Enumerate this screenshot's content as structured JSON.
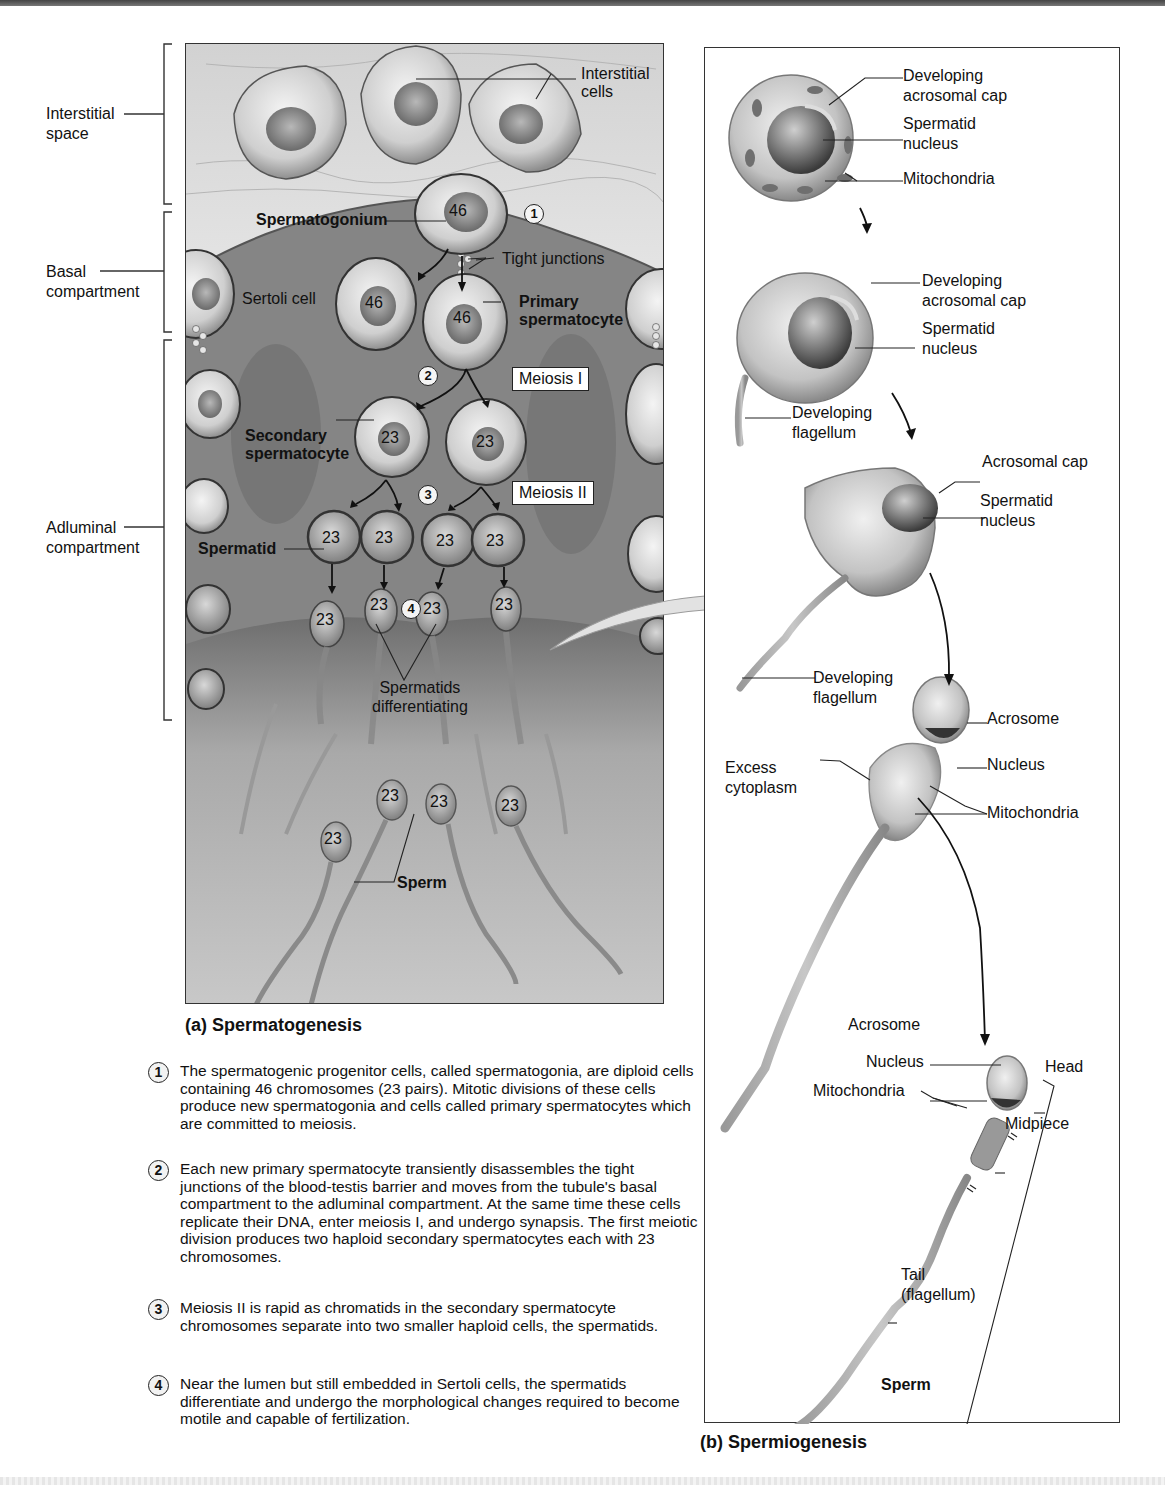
{
  "figure": {
    "panel_a": {
      "caption": "(a) Spermatogenesis",
      "region_labels": [
        {
          "id": "interstitial",
          "line1": "Interstitial",
          "line2": "space"
        },
        {
          "id": "basal",
          "line1": "Basal",
          "line2": "compartment"
        },
        {
          "id": "adluminal",
          "line1": "Adluminal",
          "line2": "compartment"
        }
      ],
      "labels": {
        "interstitial_cells_1": "Interstitial",
        "interstitial_cells_2": "cells",
        "spermatogonium": "Spermatogonium",
        "tight_junctions": "Tight junctions",
        "sertoli_cell": "Sertoli cell",
        "primary_1": "Primary",
        "primary_2": "spermatocyte",
        "meiosis_1": "Meiosis I",
        "meiosis_2": "Meiosis II",
        "secondary_1": "Secondary",
        "secondary_2": "spermatocyte",
        "spermatid": "Spermatid",
        "differentiating_1": "Spermatids",
        "differentiating_2": "differentiating",
        "sperm": "Sperm"
      },
      "chromosome_counts": {
        "spermatogonium": "46",
        "spermatogonium_daughter": "46",
        "primary_spermatocyte": "46",
        "secondary": [
          "23",
          "23"
        ],
        "spermatids": [
          "23",
          "23",
          "23",
          "23"
        ],
        "differentiating": [
          "23",
          "23",
          "23",
          "23"
        ],
        "sperm": [
          "23",
          "23",
          "23",
          "23"
        ]
      },
      "step_markers": [
        "1",
        "2",
        "3",
        "4"
      ]
    },
    "steps": [
      {
        "num": "1",
        "text": "The spermatogenic progenitor cells, called spermatogonia, are diploid cells containing 46 chromosomes (23 pairs). Mitotic divisions of these cells produce new spermatogonia and cells called primary spermatocytes which are committed to meiosis."
      },
      {
        "num": "2",
        "text": "Each new primary spermatocyte transiently disassembles the tight junctions of the blood-testis barrier and moves from the tubule's basal compartment to the adluminal compartment. At the same time these cells replicate their DNA, enter meiosis I, and undergo synapsis. The first meiotic division produces two haploid secondary spermatocytes each with 23 chromosomes."
      },
      {
        "num": "3",
        "text": "Meiosis II is rapid as chromatids in the secondary spermatocyte chromosomes separate into two smaller haploid cells, the spermatids."
      },
      {
        "num": "4",
        "text": "Near the lumen but still embedded in Sertoli cells, the spermatids differentiate and undergo the morphological changes required to become motile and capable of fertilization."
      }
    ],
    "panel_b": {
      "caption": "(b) Spermiogenesis",
      "stage1": {
        "acro_1": "Developing",
        "acro_2": "acrosomal cap",
        "nuc_1": "Spermatid",
        "nuc_2": "nucleus",
        "mito": "Mitochondria"
      },
      "stage2": {
        "acro_1": "Developing",
        "acro_2": "acrosomal cap",
        "nuc_1": "Spermatid",
        "nuc_2": "nucleus",
        "flag_1": "Developing",
        "flag_2": "flagellum"
      },
      "stage3": {
        "acro": "Acrosomal cap",
        "nuc_1": "Spermatid",
        "nuc_2": "nucleus",
        "flag_1": "Developing",
        "flag_2": "flagellum"
      },
      "stage4": {
        "acrosome": "Acrosome",
        "nucleus": "Nucleus",
        "excess_1": "Excess",
        "excess_2": "cytoplasm",
        "mito": "Mitochondria"
      },
      "stage5": {
        "acrosome": "Acrosome",
        "nucleus": "Nucleus",
        "mito": "Mitochondria",
        "head": "Head",
        "midpiece": "Midpiece",
        "tail_1": "Tail",
        "tail_2": "(flagellum)",
        "title": "Sperm"
      }
    }
  }
}
